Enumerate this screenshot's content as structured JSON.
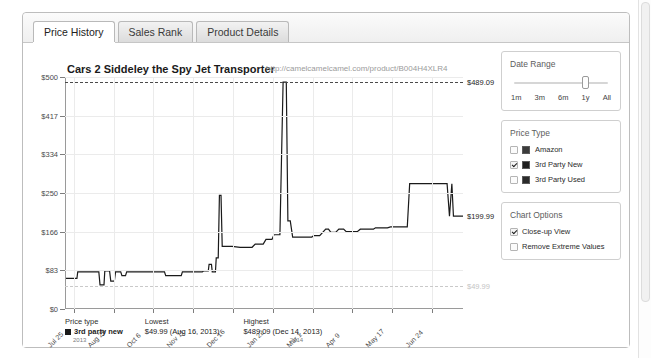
{
  "tabs": [
    {
      "label": "Price History",
      "active": true
    },
    {
      "label": "Sales Rank",
      "active": false
    },
    {
      "label": "Product Details",
      "active": false
    }
  ],
  "chart": {
    "title": "Cars 2 Siddeley the Spy Jet Transporter",
    "url": "http://camelcamelcamel.com/product/B004H4XLR4",
    "high_label": "$489.09",
    "current_label": "$199.99",
    "low_label": "$49.99"
  },
  "chart_data": {
    "type": "line",
    "title": "Cars 2 Siddeley the Spy Jet Transporter",
    "xlabel": "",
    "ylabel": "Price (USD)",
    "ylim": [
      0,
      500
    ],
    "grid": true,
    "legend": "right-panel",
    "ytick_labels": [
      "$500",
      "$417",
      "$334",
      "$250",
      "$166",
      "$83",
      "$0"
    ],
    "ytick_values": [
      500,
      417,
      334,
      250,
      166,
      83,
      0
    ],
    "xtick_labels": [
      "Jul 25",
      "Aug 29",
      "Oct 6",
      "Nov 11",
      "Dec 16",
      "Jan 22",
      "Mar 1",
      "Apr 9",
      "May 17",
      "Jun 24"
    ],
    "year_markers": [
      {
        "label": "2013",
        "x_frac": 0.02
      },
      {
        "label": "2014",
        "x_frac": 0.565
      }
    ],
    "annotations": [
      {
        "text": "$489.09",
        "type": "max-dashed-line",
        "value": 489.09
      },
      {
        "text": "$199.99",
        "type": "current-price",
        "value": 199.99
      },
      {
        "text": "$49.99",
        "type": "min-dashed-line",
        "value": 49.99
      }
    ],
    "series": [
      {
        "name": "3rd Party New",
        "color": "#1a1a1a",
        "points": [
          [
            0.0,
            66
          ],
          [
            0.03,
            66
          ],
          [
            0.032,
            80
          ],
          [
            0.075,
            80
          ],
          [
            0.085,
            80
          ],
          [
            0.088,
            52
          ],
          [
            0.098,
            52
          ],
          [
            0.1,
            82
          ],
          [
            0.112,
            82
          ],
          [
            0.115,
            60
          ],
          [
            0.124,
            60
          ],
          [
            0.127,
            80
          ],
          [
            0.14,
            80
          ],
          [
            0.143,
            72
          ],
          [
            0.152,
            72
          ],
          [
            0.155,
            80
          ],
          [
            0.25,
            80
          ],
          [
            0.253,
            72
          ],
          [
            0.292,
            72
          ],
          [
            0.295,
            80
          ],
          [
            0.345,
            80
          ],
          [
            0.348,
            82
          ],
          [
            0.36,
            82
          ],
          [
            0.362,
            96
          ],
          [
            0.368,
            96
          ],
          [
            0.37,
            80
          ],
          [
            0.378,
            80
          ],
          [
            0.38,
            110
          ],
          [
            0.385,
            110
          ],
          [
            0.388,
            245
          ],
          [
            0.392,
            245
          ],
          [
            0.395,
            135
          ],
          [
            0.42,
            135
          ],
          [
            0.44,
            133
          ],
          [
            0.47,
            133
          ],
          [
            0.478,
            140
          ],
          [
            0.498,
            140
          ],
          [
            0.505,
            150
          ],
          [
            0.52,
            150
          ],
          [
            0.525,
            160
          ],
          [
            0.54,
            160
          ],
          [
            0.548,
            489
          ],
          [
            0.556,
            489
          ],
          [
            0.56,
            190
          ],
          [
            0.566,
            190
          ],
          [
            0.572,
            155
          ],
          [
            0.62,
            155
          ],
          [
            0.625,
            158
          ],
          [
            0.64,
            158
          ],
          [
            0.655,
            172
          ],
          [
            0.662,
            172
          ],
          [
            0.668,
            165
          ],
          [
            0.68,
            165
          ],
          [
            0.688,
            172
          ],
          [
            0.7,
            172
          ],
          [
            0.706,
            167
          ],
          [
            0.735,
            167
          ],
          [
            0.742,
            172
          ],
          [
            0.775,
            172
          ],
          [
            0.78,
            175
          ],
          [
            0.81,
            175
          ],
          [
            0.818,
            177
          ],
          [
            0.86,
            177
          ],
          [
            0.866,
            270
          ],
          [
            0.96,
            270
          ],
          [
            0.966,
            200
          ],
          [
            0.972,
            270
          ],
          [
            0.976,
            200
          ],
          [
            1.0,
            200
          ]
        ]
      }
    ]
  },
  "footer": {
    "headers": [
      "Price type",
      "Lowest",
      "Highest"
    ],
    "rows": [
      {
        "price_type": "3rd party new",
        "lowest": "$49.99 (Aug 16, 2013)",
        "highest": "$489.09 (Dec 14, 2013)"
      }
    ]
  },
  "controls": {
    "date_range": {
      "title": "Date Range",
      "options": [
        "1m",
        "3m",
        "6m",
        "1y",
        "All"
      ],
      "selected": "1y"
    },
    "price_type": {
      "title": "Price Type",
      "items": [
        {
          "label": "Amazon",
          "checked": false
        },
        {
          "label": "3rd Party New",
          "checked": true
        },
        {
          "label": "3rd Party Used",
          "checked": false
        }
      ]
    },
    "chart_options": {
      "title": "Chart Options",
      "items": [
        {
          "label": "Close-up View",
          "checked": true
        },
        {
          "label": "Remove Extreme Values",
          "checked": false
        }
      ]
    }
  }
}
